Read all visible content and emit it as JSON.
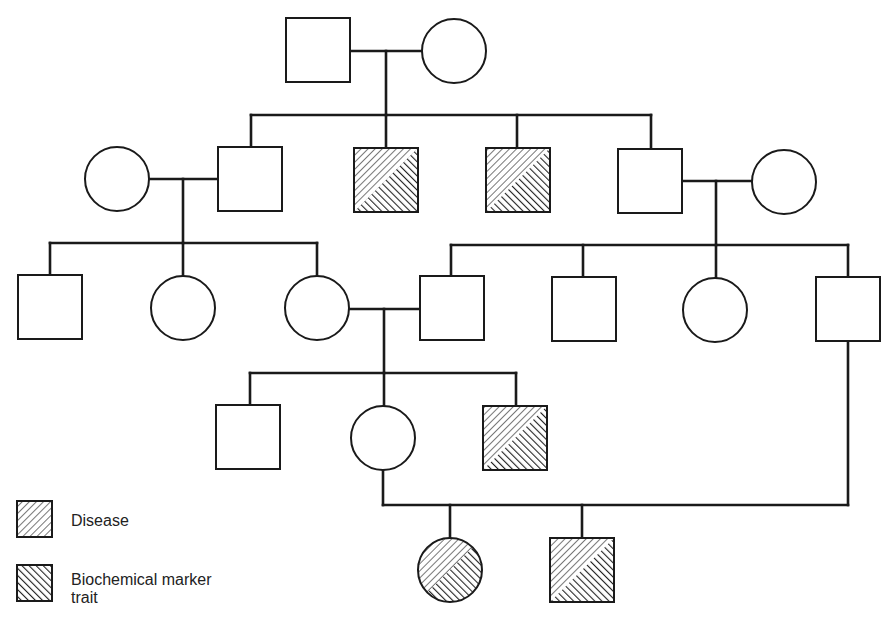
{
  "diagram": {
    "type": "pedigree",
    "colors": {
      "stroke": "#1a1a1a",
      "background": "#ffffff",
      "hatch": "#2a2a2a"
    },
    "legend": [
      {
        "id": "disease",
        "label": "Disease",
        "pattern": "hatch-forward"
      },
      {
        "id": "marker",
        "label": "Biochemical marker\ntrait",
        "label_line1": "Biochemical marker",
        "label_line2": "trait",
        "pattern": "hatch-back"
      }
    ],
    "individuals": [
      {
        "id": "I-1",
        "sex": "male",
        "x": 286,
        "y": 18,
        "affected": []
      },
      {
        "id": "I-2",
        "sex": "female",
        "x": 422,
        "y": 19,
        "affected": []
      },
      {
        "id": "II-1",
        "sex": "female",
        "x": 85,
        "y": 147,
        "affected": []
      },
      {
        "id": "II-2",
        "sex": "male",
        "x": 218,
        "y": 147,
        "affected": []
      },
      {
        "id": "II-3",
        "sex": "male",
        "x": 354,
        "y": 148,
        "affected": [
          "disease",
          "marker"
        ]
      },
      {
        "id": "II-4",
        "sex": "male",
        "x": 486,
        "y": 148,
        "affected": [
          "disease",
          "marker"
        ]
      },
      {
        "id": "II-5",
        "sex": "male",
        "x": 618,
        "y": 149,
        "affected": []
      },
      {
        "id": "II-6",
        "sex": "female",
        "x": 752,
        "y": 150,
        "affected": []
      },
      {
        "id": "III-1",
        "sex": "male",
        "x": 18,
        "y": 275,
        "affected": []
      },
      {
        "id": "III-2",
        "sex": "female",
        "x": 151,
        "y": 276,
        "affected": []
      },
      {
        "id": "III-3",
        "sex": "female",
        "x": 285,
        "y": 276,
        "affected": []
      },
      {
        "id": "III-4",
        "sex": "male",
        "x": 420,
        "y": 276,
        "affected": []
      },
      {
        "id": "III-5",
        "sex": "male",
        "x": 552,
        "y": 277,
        "affected": []
      },
      {
        "id": "III-6",
        "sex": "female",
        "x": 683,
        "y": 278,
        "affected": []
      },
      {
        "id": "III-7",
        "sex": "male",
        "x": 816,
        "y": 277,
        "affected": []
      },
      {
        "id": "IV-1",
        "sex": "male",
        "x": 216,
        "y": 405,
        "affected": []
      },
      {
        "id": "IV-2",
        "sex": "female",
        "x": 351,
        "y": 406,
        "affected": []
      },
      {
        "id": "IV-3",
        "sex": "male",
        "x": 483,
        "y": 406,
        "affected": [
          "disease",
          "marker"
        ]
      },
      {
        "id": "V-1",
        "sex": "female",
        "x": 418,
        "y": 538,
        "affected": [
          "disease",
          "marker"
        ]
      },
      {
        "id": "V-2",
        "sex": "male",
        "x": 550,
        "y": 538,
        "affected": [
          "disease",
          "marker"
        ]
      }
    ],
    "lines": [
      [
        351,
        51,
        422,
        51
      ],
      [
        386,
        51,
        386,
        115
      ],
      [
        251,
        115,
        651,
        115
      ],
      [
        251,
        115,
        251,
        147
      ],
      [
        386,
        115,
        386,
        148
      ],
      [
        517,
        115,
        517,
        148
      ],
      [
        651,
        115,
        651,
        149
      ],
      [
        149,
        179,
        218,
        179
      ],
      [
        183,
        179,
        183,
        243
      ],
      [
        683,
        181,
        752,
        181
      ],
      [
        716,
        181,
        716,
        245
      ],
      [
        50,
        243,
        317,
        243
      ],
      [
        50,
        243,
        50,
        275
      ],
      [
        183,
        243,
        183,
        276
      ],
      [
        317,
        243,
        317,
        276
      ],
      [
        451,
        245,
        848,
        245
      ],
      [
        451,
        245,
        451,
        276
      ],
      [
        583,
        245,
        583,
        277
      ],
      [
        716,
        245,
        716,
        278
      ],
      [
        848,
        245,
        848,
        277
      ],
      [
        349,
        309,
        420,
        309
      ],
      [
        384,
        309,
        384,
        373
      ],
      [
        250,
        373,
        516,
        373
      ],
      [
        250,
        373,
        250,
        405
      ],
      [
        384,
        373,
        384,
        406
      ],
      [
        516,
        373,
        516,
        406
      ],
      [
        383,
        470,
        383,
        505
      ],
      [
        848,
        342,
        848,
        505
      ],
      [
        383,
        505,
        848,
        505
      ],
      [
        450,
        505,
        450,
        538
      ],
      [
        582,
        505,
        582,
        538
      ]
    ],
    "symbol_size": 64
  }
}
